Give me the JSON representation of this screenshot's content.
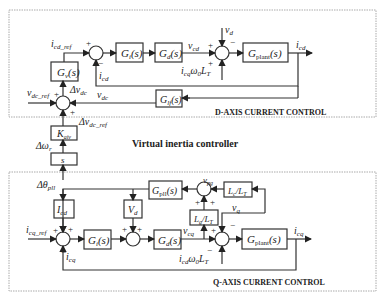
{
  "diagram": {
    "title_middle": "Virtual inertia controller",
    "d_axis": {
      "title": "D-AXIS CURRENT CONTROL",
      "blocks": {
        "gv": "G",
        "gv_sub": "v",
        "gi": "G",
        "gi_sub": "i",
        "gd": "G",
        "gd_sub": "d",
        "gplant": "G",
        "gplant_sub": "plant",
        "glf": "G",
        "glf_sub": "lf",
        "s_arg": "(s)"
      },
      "labels": {
        "icd_ref": "i",
        "icd_ref_sub": "cd_ref",
        "icd": "i",
        "icd_sub": "cd",
        "vcd": "v",
        "vcd_sub": "cd",
        "vd": "v",
        "vd_sub": "d",
        "icq_w0_lt": "i",
        "icq_w0_lt_sub": "cq",
        "w0lt": "ω",
        "w0lt_sub": "0",
        "lt": "L",
        "lt_sub": "T",
        "vdc_ref": "v",
        "vdc_ref_sub": "dc_ref",
        "delta_vdc": "Δv",
        "delta_vdc_sub": "dc",
        "vdc": "v",
        "vdc_sub": "dc",
        "delta_vdc_ref": "Δv",
        "delta_vdc_ref_sub": "dc_ref",
        "plus": "+",
        "minus": "−"
      }
    },
    "virtual_inertia": {
      "kaiv": "K",
      "kaiv_sub": "aiv",
      "s_block": "s",
      "delta_wr": "Δω",
      "delta_wr_sub": "r"
    },
    "q_axis": {
      "title": "Q-AXIS CURRENT CONTROL",
      "blocks": {
        "gpll": "G",
        "gpll_sub": "pll",
        "icd_block": "I",
        "icd_block_sub": "cd",
        "vd_block": "V",
        "vd_block_sub": "d",
        "lc_lt": "L",
        "lc_sub": "c",
        "lt_sub": "T",
        "lg_lt": "L",
        "lg_sub": "g",
        "gi": "G",
        "gi_sub": "i",
        "gd": "G",
        "gd_sub": "d",
        "gplant": "G",
        "gplant_sub": "plant"
      },
      "labels": {
        "delta_theta_pll": "Δθ",
        "delta_theta_pll_sub": "pll",
        "vpg": "v",
        "vpg_sub": "pg",
        "vq": "v",
        "vq_sub": "q",
        "icq_ref": "i",
        "icq_ref_sub": "cq_ref",
        "icq": "i",
        "icq_sub": "cq",
        "vcq": "v",
        "vcq_sub": "cq",
        "icd_w0_lt": "i",
        "icd_w0_lt_sub": "cd"
      }
    }
  }
}
